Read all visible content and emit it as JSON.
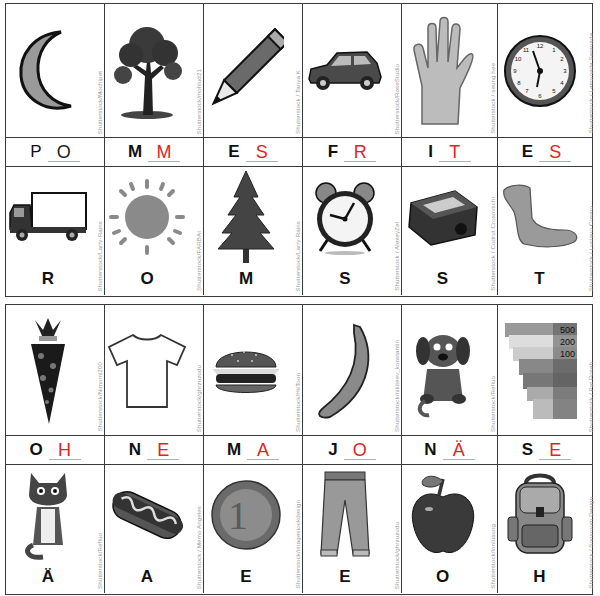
{
  "colors": {
    "grid": "#3a3a3a",
    "answer": "#e02424",
    "credit": "#9a9a9a",
    "blank_line": "#aab0c8"
  },
  "top": {
    "pictures_row1": [
      {
        "icon": "moon-icon",
        "credit": "Shutterstock/Mochipet"
      },
      {
        "icon": "tree-icon",
        "credit": "Shutterstock/mohlud21"
      },
      {
        "icon": "pencil-icon",
        "credit": "Shutterstock / Tanya K"
      },
      {
        "icon": "car-icon",
        "credit": "Shutterstock/RoseStudio"
      },
      {
        "icon": "hand-icon",
        "credit": "Shutterstock / seung hee"
      },
      {
        "icon": "clock-icon",
        "credit": "Shutterstock / Lemonade Serenade"
      }
    ],
    "words": [
      {
        "given": "P",
        "answer": "O"
      },
      {
        "given": "M",
        "answer": "M"
      },
      {
        "given": "E",
        "answer": "S"
      },
      {
        "given": "F",
        "answer": "R"
      },
      {
        "given": "I",
        "answer": "T"
      },
      {
        "given": "E",
        "answer": "S"
      }
    ],
    "pictures_row2": [
      {
        "icon": "truck-icon",
        "credit": "Shutterstock/Larry-Rains",
        "letter": "R"
      },
      {
        "icon": "sun-icon",
        "credit": "Shutterstock/FARBAI",
        "letter": "O"
      },
      {
        "icon": "fir-tree-icon",
        "credit": "Shutterstock/Larry-Rains",
        "letter": "M"
      },
      {
        "icon": "alarm-clock-icon",
        "credit": "Shutterstock / AlexeyZel",
        "letter": "S"
      },
      {
        "icon": "pencil-sharpener-icon",
        "credit": "Shutterstock / Codrut Crosovschi",
        "letter": "S"
      },
      {
        "icon": "foot-icon",
        "credit": "Shutterstock / Luciano Cosmo",
        "letter": "T"
      }
    ]
  },
  "bottom": {
    "pictures_row1": [
      {
        "icon": "school-cone-icon",
        "credit": "Shutterstock/Nimomi200"
      },
      {
        "icon": "tshirt-icon",
        "credit": "Shutterstock/ghrzuzudu"
      },
      {
        "icon": "burger-icon",
        "credit": "Shutterstock/HitToon"
      },
      {
        "icon": "banana-icon",
        "credit": "Shutterstock/nikiteev_konstantin"
      },
      {
        "icon": "puppy-icon",
        "credit": "Shutterstock/Refluo"
      },
      {
        "icon": "money-icon",
        "credit": "Shutterstock / Pat Poseh",
        "money_values": [
          "500",
          "200",
          "100"
        ]
      }
    ],
    "words": [
      {
        "given": "O",
        "answer": "H"
      },
      {
        "given": "N",
        "answer": "E"
      },
      {
        "given": "M",
        "answer": "A"
      },
      {
        "given": "J",
        "answer": "O"
      },
      {
        "given": "N",
        "answer": "Ä"
      },
      {
        "given": "S",
        "answer": "E"
      }
    ],
    "pictures_row2": [
      {
        "icon": "cat-icon",
        "credit": "Shutterstock/Refluo",
        "letter": "Ä"
      },
      {
        "icon": "hotdog-icon",
        "credit": "Shutterstock / Memo Angeles",
        "letter": "A"
      },
      {
        "icon": "euro-coin-icon",
        "credit": "Shutterstock/imagestockdesign",
        "letter": "E",
        "coin_value": "1"
      },
      {
        "icon": "jeans-icon",
        "credit": "Shutterstock/ghrzuzudu",
        "letter": "E"
      },
      {
        "icon": "apple-icon",
        "credit": "Shutterstock/lonlusung",
        "letter": "O"
      },
      {
        "icon": "backpack-icon",
        "credit": "Shutterstock / Sonsroom Design",
        "letter": "H"
      }
    ]
  }
}
